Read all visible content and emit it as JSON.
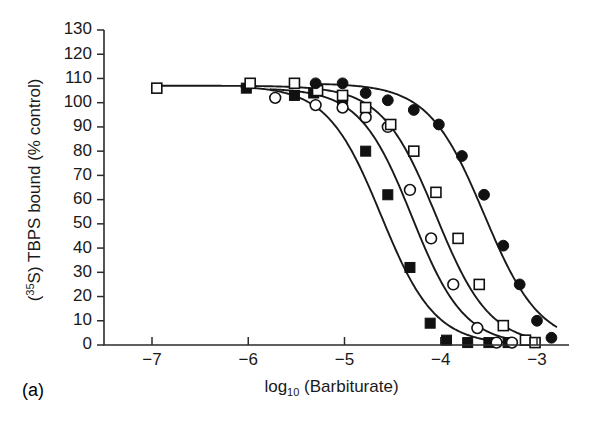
{
  "figure": {
    "panel_label": "(a)",
    "background_color": "#ffffff",
    "ink_color": "#1a1a1a"
  },
  "chart_data": {
    "type": "line",
    "title": "",
    "subtitle": "",
    "xlabel": "log10 (Barbiturate)",
    "xlabel_parts": {
      "base": "log",
      "subscript": "10",
      "rest": " (Barbiturate)"
    },
    "ylabel": "(35S) TBPS bound (% control)",
    "ylabel_parts": {
      "prefix": "(",
      "superscript": "35",
      "rest": "S) TBPS bound (% control)"
    },
    "xlim": [
      -7.5,
      -2.6
    ],
    "ylim": [
      0,
      130
    ],
    "xticks": [
      -7,
      -6,
      -5,
      -4,
      -3
    ],
    "xtick_labels": [
      "−7",
      "−6",
      "−5",
      "−4",
      "−3"
    ],
    "yticks": [
      0,
      10,
      20,
      30,
      40,
      50,
      60,
      70,
      80,
      90,
      100,
      110,
      120,
      130
    ],
    "ytick_labels": [
      "0",
      "10",
      "20",
      "30",
      "40",
      "50",
      "60",
      "70",
      "80",
      "90",
      "100",
      "110",
      "120",
      "130"
    ],
    "grid": false,
    "legend": "none",
    "legend_position": "none",
    "series": [
      {
        "name": "filled-square",
        "marker": "filled-square",
        "color": "#111111",
        "ic50_log": -4.62,
        "top": 107,
        "hill": 1.55,
        "points": [
          {
            "x": -6.02,
            "y": 106
          },
          {
            "x": -5.52,
            "y": 103
          },
          {
            "x": -5.32,
            "y": 104
          },
          {
            "x": -5.02,
            "y": 100
          },
          {
            "x": -4.78,
            "y": 80
          },
          {
            "x": -4.55,
            "y": 62
          },
          {
            "x": -4.32,
            "y": 32
          },
          {
            "x": -4.11,
            "y": 9
          },
          {
            "x": -3.94,
            "y": 2
          },
          {
            "x": -3.72,
            "y": 1
          },
          {
            "x": -3.5,
            "y": 1
          },
          {
            "x": -3.3,
            "y": 1
          }
        ]
      },
      {
        "name": "open-circle",
        "marker": "open-circle",
        "color": "#111111",
        "ic50_log": -4.3,
        "top": 106,
        "hill": 1.6,
        "points": [
          {
            "x": -5.72,
            "y": 102
          },
          {
            "x": -5.3,
            "y": 99
          },
          {
            "x": -5.02,
            "y": 98
          },
          {
            "x": -4.78,
            "y": 94
          },
          {
            "x": -4.55,
            "y": 90
          },
          {
            "x": -4.32,
            "y": 64
          },
          {
            "x": -4.1,
            "y": 44
          },
          {
            "x": -3.87,
            "y": 25
          },
          {
            "x": -3.62,
            "y": 7
          },
          {
            "x": -3.42,
            "y": 1
          },
          {
            "x": -3.26,
            "y": 1
          }
        ]
      },
      {
        "name": "open-square",
        "marker": "open-square",
        "color": "#111111",
        "ic50_log": -4.05,
        "top": 107,
        "hill": 1.55,
        "points": [
          {
            "x": -6.95,
            "y": 106
          },
          {
            "x": -5.98,
            "y": 108
          },
          {
            "x": -5.52,
            "y": 108
          },
          {
            "x": -5.28,
            "y": 105
          },
          {
            "x": -5.02,
            "y": 103
          },
          {
            "x": -4.78,
            "y": 98
          },
          {
            "x": -4.52,
            "y": 91
          },
          {
            "x": -4.28,
            "y": 80
          },
          {
            "x": -4.05,
            "y": 63
          },
          {
            "x": -3.82,
            "y": 44
          },
          {
            "x": -3.6,
            "y": 25
          },
          {
            "x": -3.35,
            "y": 8
          },
          {
            "x": -3.12,
            "y": 2
          },
          {
            "x": -3.02,
            "y": 1
          }
        ]
      },
      {
        "name": "filled-circle",
        "marker": "filled-circle",
        "color": "#111111",
        "ic50_log": -3.55,
        "top": 108,
        "hill": 1.5,
        "points": [
          {
            "x": -5.3,
            "y": 108
          },
          {
            "x": -5.02,
            "y": 108
          },
          {
            "x": -4.78,
            "y": 104
          },
          {
            "x": -4.55,
            "y": 101
          },
          {
            "x": -4.28,
            "y": 97
          },
          {
            "x": -4.02,
            "y": 91
          },
          {
            "x": -3.78,
            "y": 78
          },
          {
            "x": -3.55,
            "y": 62
          },
          {
            "x": -3.35,
            "y": 41
          },
          {
            "x": -3.18,
            "y": 25
          },
          {
            "x": -3.0,
            "y": 10
          },
          {
            "x": -2.85,
            "y": 3
          }
        ]
      }
    ]
  }
}
